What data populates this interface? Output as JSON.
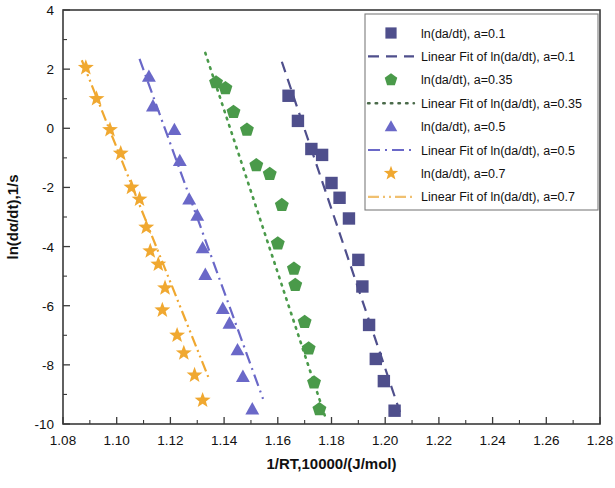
{
  "chart_data": {
    "type": "scatter",
    "title": "",
    "xlabel": "1/RT,10000/(J/mol)",
    "ylabel": "ln(dα/dt),1/s",
    "xlim": [
      1.08,
      1.28
    ],
    "ylim": [
      -10,
      4
    ],
    "xticks": [
      "1.08",
      "1.10",
      "1.12",
      "1.14",
      "1.16",
      "1.18",
      "1.20",
      "1.22",
      "1.24",
      "1.26",
      "1.28"
    ],
    "xtick_values": [
      1.08,
      1.1,
      1.12,
      1.14,
      1.16,
      1.18,
      1.2,
      1.22,
      1.24,
      1.26,
      1.28
    ],
    "yticks": [
      "4",
      "2",
      "0",
      "-2",
      "-4",
      "-6",
      "-8",
      "-10"
    ],
    "ytick_values": [
      4,
      2,
      0,
      -2,
      -4,
      -6,
      -8,
      -10
    ],
    "minor_ticks": true,
    "grid": false,
    "legend_position": "top-right",
    "series": [
      {
        "name": "ln(da/dt), a=0.1",
        "marker": "square",
        "color": "#4f4f8c",
        "fit_name": "Linear Fit of ln(da/dt), a=0.1",
        "fit_style": "dashed",
        "fit_endpoints": [
          [
            1.1615,
            2.25
          ],
          [
            1.2055,
            -9.6
          ]
        ],
        "points": [
          [
            1.164,
            1.1
          ],
          [
            1.1675,
            0.25
          ],
          [
            1.1725,
            -0.7
          ],
          [
            1.1765,
            -0.9
          ],
          [
            1.18,
            -1.85
          ],
          [
            1.183,
            -2.35
          ],
          [
            1.1865,
            -3.05
          ],
          [
            1.19,
            -4.45
          ],
          [
            1.1915,
            -5.35
          ],
          [
            1.194,
            -6.65
          ],
          [
            1.1965,
            -7.8
          ],
          [
            1.1995,
            -8.55
          ],
          [
            1.2035,
            -9.55
          ]
        ]
      },
      {
        "name": "ln(da/dt), a=0.35",
        "marker": "pentagon",
        "color": "#4a9a4a",
        "fit_name": "Linear Fit of ln(da/dt), a=0.35",
        "fit_style": "dotted",
        "fit_endpoints": [
          [
            1.133,
            2.55
          ],
          [
            1.178,
            -9.85
          ]
        ],
        "points": [
          [
            1.137,
            1.55
          ],
          [
            1.1405,
            1.35
          ],
          [
            1.1435,
            0.55
          ],
          [
            1.1485,
            -0.05
          ],
          [
            1.152,
            -1.25
          ],
          [
            1.157,
            -1.55
          ],
          [
            1.1615,
            -2.6
          ],
          [
            1.16,
            -3.9
          ],
          [
            1.166,
            -4.75
          ],
          [
            1.1665,
            -5.3
          ],
          [
            1.17,
            -6.55
          ],
          [
            1.1715,
            -7.45
          ],
          [
            1.1735,
            -8.6
          ],
          [
            1.1755,
            -9.5
          ]
        ]
      },
      {
        "name": "ln(da/dt), a=0.5",
        "marker": "triangle",
        "color": "#6a68c8",
        "fit_name": "Linear Fit of ln(da/dt), a=0.5",
        "fit_style": "dash-dot",
        "fit_endpoints": [
          [
            1.1085,
            2.35
          ],
          [
            1.1545,
            -9.15
          ]
        ],
        "points": [
          [
            1.112,
            1.75
          ],
          [
            1.1135,
            0.75
          ],
          [
            1.1215,
            -0.05
          ],
          [
            1.1235,
            -1.1
          ],
          [
            1.127,
            -2.4
          ],
          [
            1.13,
            -2.95
          ],
          [
            1.132,
            -4.05
          ],
          [
            1.133,
            -4.95
          ],
          [
            1.1395,
            -6.1
          ],
          [
            1.142,
            -6.6
          ],
          [
            1.145,
            -7.5
          ],
          [
            1.147,
            -8.4
          ],
          [
            1.1505,
            -9.5
          ]
        ]
      },
      {
        "name": "ln(da/dt), a=0.7",
        "marker": "star",
        "color": "#f0a830",
        "fit_name": "Linear Fit of ln(da/dt), a=0.7",
        "fit_style": "dash-dot-dot",
        "fit_endpoints": [
          [
            1.087,
            2.3
          ],
          [
            1.1345,
            -8.5
          ]
        ],
        "points": [
          [
            1.0885,
            2.05
          ],
          [
            1.0925,
            1.0
          ],
          [
            1.0975,
            -0.05
          ],
          [
            1.1015,
            -0.85
          ],
          [
            1.1055,
            -2.0
          ],
          [
            1.1085,
            -2.4
          ],
          [
            1.111,
            -3.35
          ],
          [
            1.1125,
            -4.15
          ],
          [
            1.1155,
            -4.6
          ],
          [
            1.118,
            -5.4
          ],
          [
            1.117,
            -6.15
          ],
          [
            1.1225,
            -7.0
          ],
          [
            1.125,
            -7.6
          ],
          [
            1.129,
            -8.35
          ],
          [
            1.132,
            -9.2
          ]
        ]
      }
    ]
  },
  "legend": {
    "entries": [
      {
        "label": "ln(da/dt), a=0.1",
        "kind": "marker",
        "marker": "square",
        "color": "#4f4f8c"
      },
      {
        "label": "Linear Fit of ln(da/dt), a=0.1",
        "kind": "line",
        "style": "dashed",
        "color": "#4f4f8c"
      },
      {
        "label": "ln(da/dt), a=0.35",
        "kind": "marker",
        "marker": "pentagon",
        "color": "#4a9a4a"
      },
      {
        "label": "Linear Fit of ln(da/dt), a=0.35",
        "kind": "line",
        "style": "dotted",
        "color": "#4a6a4a"
      },
      {
        "label": "ln(da/dt), a=0.5",
        "kind": "marker",
        "marker": "triangle",
        "color": "#6a68c8"
      },
      {
        "label": "Linear Fit of ln(da/dt), a=0.5",
        "kind": "line",
        "style": "dash-dot",
        "color": "#6a68c8"
      },
      {
        "label": "ln(da/dt), a=0.7",
        "kind": "marker",
        "marker": "star",
        "color": "#f0a830"
      },
      {
        "label": "Linear Fit of ln(da/dt), a=0.7",
        "kind": "line",
        "style": "dash-dot-dot",
        "color": "#f0c070"
      }
    ]
  }
}
